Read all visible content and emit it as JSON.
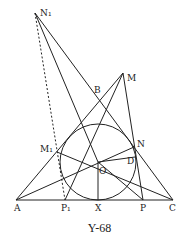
{
  "caption": "Y-68",
  "labels": {
    "N1": "N₁",
    "M": "M",
    "B": "B",
    "M1": "M₁",
    "N": "N",
    "D": "D",
    "O": "O",
    "A": "A",
    "P1": "P₁",
    "X": "X",
    "P": "P",
    "C": "C"
  },
  "stroke_color": "#222222"
}
